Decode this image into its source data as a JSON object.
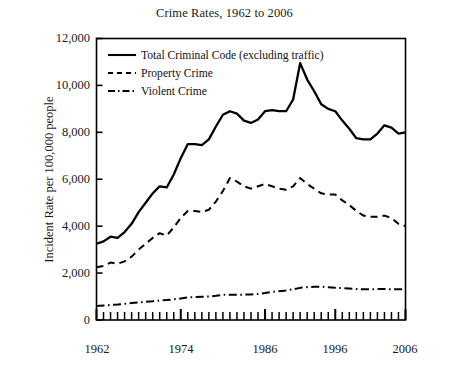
{
  "chart_data": {
    "type": "line",
    "title": "Crime Rates, 1962 to 2006",
    "xlabel": "",
    "ylabel": "Incident Rate per 100,000 people",
    "xlim": [
      1962,
      2006
    ],
    "ylim": [
      0,
      12000
    ],
    "yticks": [
      0,
      2000,
      4000,
      6000,
      8000,
      10000,
      12000
    ],
    "ytick_labels": [
      "0",
      "2,000",
      "4,000",
      "6,000",
      "8,000",
      "10,000",
      "12,000"
    ],
    "xticks": [
      1962,
      1974,
      1986,
      1996,
      2006
    ],
    "xtick_labels": [
      "1962",
      "1974",
      "1986",
      "1996",
      "2006"
    ],
    "x_minor_tick_interval": 1,
    "grid": false,
    "legend_position": "top-left-inside",
    "x": [
      1962,
      1963,
      1964,
      1965,
      1966,
      1967,
      1968,
      1969,
      1970,
      1971,
      1972,
      1973,
      1974,
      1975,
      1976,
      1977,
      1978,
      1979,
      1980,
      1981,
      1982,
      1983,
      1984,
      1985,
      1986,
      1987,
      1988,
      1989,
      1990,
      1991,
      1992,
      1993,
      1994,
      1995,
      1996,
      1997,
      1998,
      1999,
      2000,
      2001,
      2002,
      2003,
      2004,
      2005,
      2006
    ],
    "series": [
      {
        "name": "Total Criminal Code (excluding traffic)",
        "style": "solid",
        "color": "#000000",
        "values": [
          3250,
          3350,
          3550,
          3500,
          3750,
          4100,
          4600,
          5000,
          5400,
          5700,
          5650,
          6200,
          6900,
          7500,
          7500,
          7450,
          7700,
          8250,
          8750,
          8900,
          8800,
          8500,
          8400,
          8550,
          8900,
          8950,
          8900,
          8900,
          9400,
          10950,
          10250,
          9750,
          9200,
          9000,
          8900,
          8500,
          8150,
          7750,
          7700,
          7700,
          7950,
          8300,
          8200,
          7950,
          8000
        ]
      },
      {
        "name": "Property Crime",
        "style": "dashed",
        "color": "#000000",
        "values": [
          2250,
          2300,
          2450,
          2400,
          2500,
          2700,
          3000,
          3250,
          3500,
          3700,
          3600,
          3950,
          4350,
          4650,
          4650,
          4600,
          4700,
          5050,
          5500,
          6050,
          5900,
          5700,
          5600,
          5700,
          5800,
          5700,
          5600,
          5550,
          5700,
          6050,
          5800,
          5600,
          5400,
          5350,
          5350,
          5100,
          4900,
          4650,
          4450,
          4400,
          4400,
          4450,
          4350,
          4100,
          4000
        ]
      },
      {
        "name": "Violent Crime",
        "style": "dashdot",
        "color": "#000000",
        "values": [
          600,
          620,
          640,
          660,
          690,
          720,
          750,
          780,
          800,
          830,
          850,
          880,
          920,
          960,
          980,
          990,
          1000,
          1030,
          1070,
          1080,
          1080,
          1080,
          1090,
          1110,
          1150,
          1200,
          1230,
          1260,
          1310,
          1370,
          1400,
          1420,
          1420,
          1400,
          1380,
          1360,
          1340,
          1320,
          1310,
          1310,
          1320,
          1320,
          1310,
          1310,
          1320
        ]
      }
    ]
  },
  "axes": {
    "title": "Crime Rates, 1962 to 2006",
    "y_axis_title": "Incident Rate per 100,000 people"
  }
}
